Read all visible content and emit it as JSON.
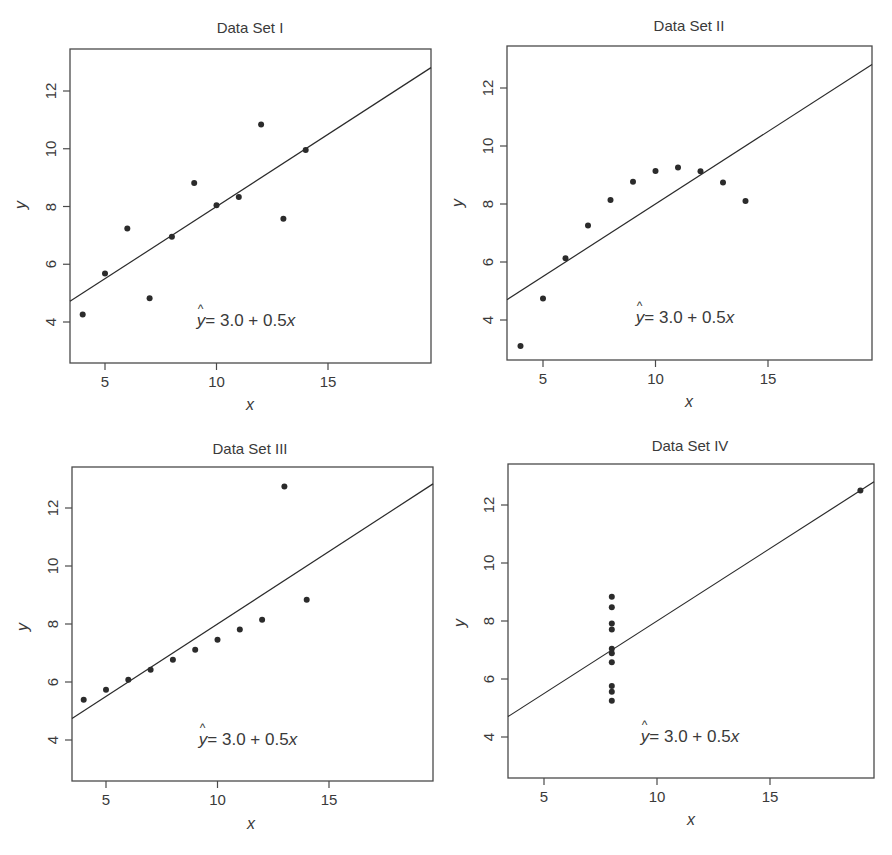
{
  "chart_data": [
    {
      "type": "scatter",
      "title": "Data Set I",
      "xlabel": "x",
      "ylabel": "y",
      "xlim": [
        3.5,
        19.6
      ],
      "ylim": [
        2.5,
        13.4
      ],
      "xticks": [
        5,
        10,
        15
      ],
      "yticks": [
        4,
        6,
        8,
        10,
        12
      ],
      "grid": false,
      "annotation": "ŷ = 3.0 + 0.5x",
      "fit_line": {
        "intercept": 3.0,
        "slope": 0.5
      },
      "x": [
        4,
        5,
        6,
        7,
        8,
        9,
        10,
        11,
        12,
        13,
        14
      ],
      "y": [
        4.26,
        5.68,
        7.24,
        4.82,
        6.95,
        8.81,
        8.04,
        8.33,
        10.84,
        7.58,
        9.96
      ]
    },
    {
      "type": "scatter",
      "title": "Data Set II",
      "xlabel": "x",
      "ylabel": "y",
      "xlim": [
        3.5,
        19.6
      ],
      "ylim": [
        2.5,
        13.4
      ],
      "xticks": [
        5,
        10,
        15
      ],
      "yticks": [
        4,
        6,
        8,
        10,
        12
      ],
      "grid": false,
      "annotation": "ŷ = 3.0 + 0.5x",
      "fit_line": {
        "intercept": 3.0,
        "slope": 0.5
      },
      "x": [
        4,
        5,
        6,
        7,
        8,
        9,
        10,
        11,
        12,
        13,
        14
      ],
      "y": [
        3.1,
        4.74,
        6.13,
        7.26,
        8.14,
        8.77,
        9.14,
        9.26,
        9.13,
        8.74,
        8.1
      ]
    },
    {
      "type": "scatter",
      "title": "Data Set III",
      "xlabel": "x",
      "ylabel": "y",
      "xlim": [
        3.5,
        19.6
      ],
      "ylim": [
        2.5,
        13.4
      ],
      "xticks": [
        5,
        10,
        15
      ],
      "yticks": [
        4,
        6,
        8,
        10,
        12
      ],
      "grid": false,
      "annotation": "ŷ = 3.0 + 0.5x",
      "fit_line": {
        "intercept": 3.0,
        "slope": 0.5
      },
      "x": [
        4,
        5,
        6,
        7,
        8,
        9,
        10,
        11,
        12,
        13,
        14
      ],
      "y": [
        5.39,
        5.73,
        6.08,
        6.42,
        6.77,
        7.11,
        7.46,
        7.81,
        8.15,
        12.74,
        8.84
      ]
    },
    {
      "type": "scatter",
      "title": "Data Set IV",
      "xlabel": "x",
      "ylabel": "y",
      "xlim": [
        3.5,
        19.6
      ],
      "ylim": [
        2.5,
        13.4
      ],
      "xticks": [
        5,
        10,
        15
      ],
      "yticks": [
        4,
        6,
        8,
        10,
        12
      ],
      "grid": false,
      "annotation": "ŷ = 3.0 + 0.5x",
      "fit_line": {
        "intercept": 3.0,
        "slope": 0.5
      },
      "x": [
        8,
        8,
        8,
        8,
        8,
        8,
        8,
        19,
        8,
        8,
        8
      ],
      "y": [
        6.58,
        5.76,
        7.71,
        8.84,
        8.47,
        7.04,
        5.25,
        12.5,
        5.56,
        7.91,
        6.89
      ]
    }
  ],
  "panels": [
    {
      "title": "Data Set I",
      "xlabel": "x",
      "ylabel": "y",
      "eq_prefix": "y",
      "eq_mid": "= 3.0 + 0.5",
      "eq_var": "x"
    },
    {
      "title": "Data Set II",
      "xlabel": "x",
      "ylabel": "y",
      "eq_prefix": "y",
      "eq_mid": "= 3.0 + 0.5",
      "eq_var": "x"
    },
    {
      "title": "Data Set III",
      "xlabel": "x",
      "ylabel": "y",
      "eq_prefix": "y",
      "eq_mid": "= 3.0 + 0.5",
      "eq_var": "x"
    },
    {
      "title": "Data Set IV",
      "xlabel": "x",
      "ylabel": "y",
      "eq_prefix": "y",
      "eq_mid": "= 3.0 + 0.5",
      "eq_var": "x"
    }
  ],
  "style": {
    "ink": "#2b2b2b",
    "frame": "#4a4a4a",
    "background": "#ffffff"
  }
}
